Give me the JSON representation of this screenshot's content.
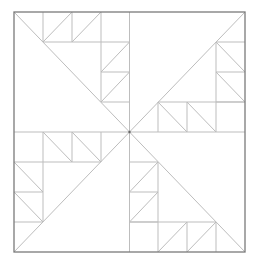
{
  "diagram": {
    "title": "",
    "colors": {
      "border": "#7a7a7a",
      "inner_lines": "#bdbdbd",
      "background": "#ffffff"
    },
    "border": {
      "x": 14,
      "y": 12,
      "width": 231,
      "height": 240
    },
    "center": {
      "x": 129.5,
      "y": 132
    },
    "grid": {
      "x": [
        14,
        43,
        72,
        101,
        129.5,
        158,
        187,
        216,
        245
      ],
      "y": [
        12,
        42,
        72,
        102,
        132,
        162,
        192,
        222,
        252
      ]
    },
    "quadrants": [
      {
        "name": "top-left",
        "lines": [
          [
            14,
            12,
            129.5,
            132
          ],
          [
            43,
            12,
            43,
            42
          ],
          [
            72,
            12,
            72,
            42
          ],
          [
            101,
            12,
            101,
            102
          ],
          [
            43,
            42,
            129.5,
            42
          ],
          [
            43,
            42,
            72,
            12
          ],
          [
            72,
            42,
            101,
            12
          ],
          [
            101,
            72,
            129.5,
            72
          ],
          [
            101,
            102,
            129.5,
            102
          ],
          [
            101,
            72,
            129.5,
            42
          ],
          [
            101,
            102,
            129.5,
            72
          ]
        ]
      },
      {
        "name": "top-right",
        "lines": [
          [
            129.5,
            132,
            245,
            12
          ],
          [
            216,
            42,
            216,
            132
          ],
          [
            216,
            42,
            245,
            42
          ],
          [
            216,
            72,
            245,
            72
          ],
          [
            216,
            102,
            245,
            102
          ],
          [
            216,
            42,
            245,
            72
          ],
          [
            216,
            72,
            245,
            102
          ],
          [
            158,
            102,
            245,
            102
          ],
          [
            158,
            102,
            158,
            132
          ],
          [
            187,
            102,
            187,
            132
          ],
          [
            158,
            102,
            187,
            132
          ],
          [
            187,
            102,
            216,
            132
          ]
        ]
      },
      {
        "name": "bottom-left",
        "lines": [
          [
            14,
            252,
            129.5,
            132
          ],
          [
            43,
            132,
            43,
            222
          ],
          [
            72,
            132,
            72,
            162
          ],
          [
            101,
            132,
            101,
            162
          ],
          [
            14,
            162,
            101,
            162
          ],
          [
            43,
            132,
            72,
            162
          ],
          [
            72,
            132,
            101,
            162
          ],
          [
            14,
            192,
            43,
            192
          ],
          [
            14,
            222,
            43,
            222
          ],
          [
            14,
            162,
            43,
            192
          ],
          [
            14,
            192,
            43,
            222
          ]
        ]
      },
      {
        "name": "bottom-right",
        "lines": [
          [
            129.5,
            132,
            245,
            252
          ],
          [
            158,
            162,
            158,
            252
          ],
          [
            129.5,
            162,
            158,
            162
          ],
          [
            129.5,
            192,
            158,
            192
          ],
          [
            129.5,
            222,
            158,
            222
          ],
          [
            129.5,
            192,
            158,
            162
          ],
          [
            129.5,
            222,
            158,
            192
          ],
          [
            129.5,
            222,
            216,
            222
          ],
          [
            187,
            222,
            187,
            252
          ],
          [
            216,
            222,
            216,
            252
          ],
          [
            158,
            252,
            187,
            222
          ],
          [
            187,
            252,
            216,
            222
          ]
        ]
      }
    ],
    "center_lines": [
      [
        14,
        132,
        245,
        132
      ],
      [
        129.5,
        12,
        129.5,
        252
      ]
    ]
  }
}
